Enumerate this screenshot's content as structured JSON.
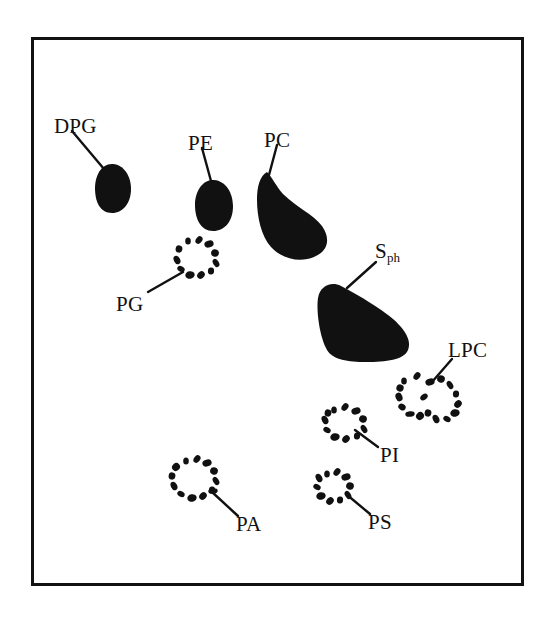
{
  "figure": {
    "type": "anatomical-diagram",
    "background_color": "#ffffff",
    "ink_color": "#111111",
    "frame": {
      "x": 31,
      "y": 37,
      "width": 493,
      "height": 549,
      "border_width": 3,
      "border_color": "#121212"
    }
  },
  "labels": [
    {
      "id": "DPG",
      "text": "DPG",
      "x": 54,
      "y": 116,
      "anchor": "start"
    },
    {
      "id": "PE",
      "text": "PE",
      "x": 188,
      "y": 133,
      "anchor": "start"
    },
    {
      "id": "PC",
      "text": "PC",
      "x": 264,
      "y": 130,
      "anchor": "start"
    },
    {
      "id": "PG",
      "text": "PG",
      "x": 116,
      "y": 294,
      "anchor": "start"
    },
    {
      "id": "Sph",
      "text": "S",
      "subscript": "ph",
      "x": 375,
      "y": 241,
      "anchor": "start"
    },
    {
      "id": "LPC",
      "text": "LPC",
      "x": 448,
      "y": 340,
      "anchor": "start"
    },
    {
      "id": "PI",
      "text": "PI",
      "x": 380,
      "y": 445,
      "anchor": "start"
    },
    {
      "id": "PA",
      "text": "PA",
      "x": 236,
      "y": 514,
      "anchor": "start"
    },
    {
      "id": "PS",
      "text": "PS",
      "x": 368,
      "y": 512,
      "anchor": "start"
    }
  ],
  "leader_lines": [
    {
      "id": "DPG-leader",
      "x1": 72,
      "y1": 131,
      "x2": 104,
      "y2": 169
    },
    {
      "id": "PE-leader",
      "x1": 202,
      "y1": 148,
      "x2": 211,
      "y2": 181
    },
    {
      "id": "PC-leader",
      "x1": 277,
      "y1": 145,
      "x2": 269,
      "y2": 175
    },
    {
      "id": "PG-leader",
      "x1": 148,
      "y1": 292,
      "x2": 183,
      "y2": 272
    },
    {
      "id": "Sph-leader",
      "x1": 376,
      "y1": 262,
      "x2": 347,
      "y2": 288
    },
    {
      "id": "LPC-leader",
      "x1": 452,
      "y1": 359,
      "x2": 432,
      "y2": 382
    },
    {
      "id": "PI-leader",
      "x1": 378,
      "y1": 447,
      "x2": 355,
      "y2": 430
    },
    {
      "id": "PA-leader",
      "x1": 238,
      "y1": 516,
      "x2": 212,
      "y2": 492
    },
    {
      "id": "PS-leader",
      "x1": 370,
      "y1": 514,
      "x2": 346,
      "y2": 494
    }
  ],
  "solid_pads": [
    {
      "id": "DPG-pad",
      "name": "digital-pad-DPG",
      "fill": "#111111",
      "path": "M113,164 C124,165 131,176 131,189 C131,203 123,213 112,213 C100,213 95,202 95,188 C95,175 102,163 113,164 Z"
    },
    {
      "id": "PE-pad",
      "name": "digital-pad-PE",
      "fill": "#111111",
      "path": "M214,180 C226,181 233,193 233,206 C233,221 225,231 213,231 C201,231 195,219 195,205 C195,191 203,179 214,180 Z"
    },
    {
      "id": "PC-pad",
      "name": "digital-pad-PC",
      "fill": "#111111",
      "path": "M267,172 C272,177 276,186 283,194 C296,207 313,214 322,226 C331,239 328,251 314,257 C300,263 282,259 271,247 C261,236 257,216 257,200 C257,186 260,176 267,172 Z"
    },
    {
      "id": "Sph-pad",
      "name": "metacarpal-pad-Sph",
      "fill": "#111111",
      "path": "M341,286 C353,292 372,303 388,315 C404,327 412,340 408,350 C404,360 386,362 366,362 C348,362 333,360 327,350 C320,338 316,312 318,298 C320,286 331,281 341,286 Z"
    }
  ],
  "dotted_pads": [
    {
      "id": "PG-pad",
      "name": "dotted-pad-PG",
      "dots": [
        [
          188,
          241
        ],
        [
          199,
          240
        ],
        [
          209,
          244
        ],
        [
          215,
          253
        ],
        [
          216,
          263
        ],
        [
          211,
          271
        ],
        [
          201,
          275
        ],
        [
          190,
          275
        ],
        [
          181,
          269
        ],
        [
          177,
          260
        ],
        [
          179,
          249
        ]
      ]
    },
    {
      "id": "LPC-pad",
      "name": "dotted-pad-LPC",
      "dots": [
        [
          404,
          381
        ],
        [
          417,
          376
        ],
        [
          430,
          382
        ],
        [
          441,
          379
        ],
        [
          450,
          385
        ],
        [
          456,
          394
        ],
        [
          458,
          404
        ],
        [
          455,
          413
        ],
        [
          447,
          419
        ],
        [
          436,
          419
        ],
        [
          428,
          413
        ],
        [
          420,
          416
        ],
        [
          410,
          414
        ],
        [
          402,
          407
        ],
        [
          399,
          397
        ],
        [
          400,
          388
        ],
        [
          424,
          397
        ]
      ]
    },
    {
      "id": "PI-pad",
      "name": "dotted-pad-PI",
      "dots": [
        [
          334,
          410
        ],
        [
          345,
          407
        ],
        [
          356,
          411
        ],
        [
          363,
          419
        ],
        [
          364,
          429
        ],
        [
          357,
          436
        ],
        [
          346,
          439
        ],
        [
          335,
          437
        ],
        [
          327,
          430
        ],
        [
          325,
          420
        ],
        [
          328,
          413
        ]
      ]
    },
    {
      "id": "PA-pad",
      "name": "dotted-pad-PA",
      "dots": [
        [
          186,
          461
        ],
        [
          197,
          459
        ],
        [
          207,
          463
        ],
        [
          214,
          471
        ],
        [
          216,
          481
        ],
        [
          212,
          490
        ],
        [
          203,
          496
        ],
        [
          192,
          498
        ],
        [
          181,
          494
        ],
        [
          174,
          486
        ],
        [
          172,
          476
        ],
        [
          176,
          467
        ],
        [
          213,
          491
        ]
      ]
    },
    {
      "id": "PS-pad",
      "name": "dotted-pad-PS",
      "dots": [
        [
          327,
          474
        ],
        [
          337,
          472
        ],
        [
          346,
          477
        ],
        [
          350,
          486
        ],
        [
          348,
          495
        ],
        [
          340,
          500
        ],
        [
          330,
          501
        ],
        [
          321,
          496
        ],
        [
          317,
          487
        ],
        [
          319,
          478
        ]
      ]
    }
  ]
}
